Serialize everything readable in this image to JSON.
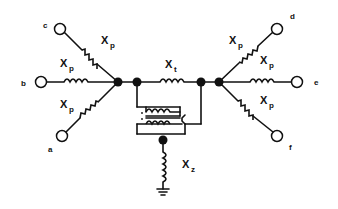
{
  "diagram": {
    "type": "circuit-schematic",
    "terminals": [
      {
        "id": "c",
        "label": "c"
      },
      {
        "id": "b",
        "label": "b"
      },
      {
        "id": "a",
        "label": "a"
      },
      {
        "id": "d",
        "label": "d"
      },
      {
        "id": "e",
        "label": "e"
      },
      {
        "id": "f",
        "label": "f"
      }
    ],
    "reactances": {
      "phase": {
        "symbol": "X",
        "subscript": "p"
      },
      "tie": {
        "symbol": "X",
        "subscript": "t"
      },
      "ground": {
        "symbol": "X",
        "subscript": "z"
      }
    },
    "edges": [
      {
        "from": "c",
        "to": "left-hub",
        "element": "Xp"
      },
      {
        "from": "b",
        "to": "left-hub",
        "element": "Xp"
      },
      {
        "from": "a",
        "to": "left-hub",
        "element": "Xp"
      },
      {
        "from": "d",
        "to": "right-hub",
        "element": "Xp"
      },
      {
        "from": "e",
        "to": "right-hub",
        "element": "Xp"
      },
      {
        "from": "f",
        "to": "right-hub",
        "element": "Xp"
      },
      {
        "from": "left-inner",
        "to": "right-inner",
        "element": "Xt"
      },
      {
        "from": "transformer-node",
        "to": "ground",
        "element": "Xz"
      }
    ],
    "colors": {
      "ink": "#111111",
      "background": "#ffffff"
    }
  }
}
